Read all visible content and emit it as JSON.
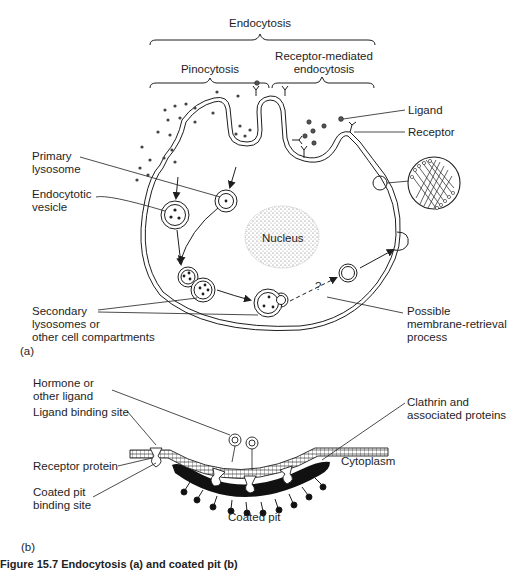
{
  "panel_a": {
    "label": "(a)",
    "brackets": {
      "top": "Endocytosis",
      "left": "Pinocytosis",
      "right_line1": "Receptor-mediated",
      "right_line2": "endocytosis"
    },
    "labels": {
      "ligand": "Ligand",
      "receptor": "Receptor",
      "primary_lysosome_1": "Primary",
      "primary_lysosome_2": "lysosome",
      "endocytotic_vesicle_1": "Endocytotic",
      "endocytotic_vesicle_2": "vesicle",
      "nucleus": "Nucleus",
      "secondary_1": "Secondary",
      "secondary_2": "lysosomes or",
      "secondary_3": "other cell compartments",
      "retrieval_1": "Possible",
      "retrieval_2": "membrane-retrieval",
      "retrieval_3": "process",
      "question_mark": "?"
    }
  },
  "panel_b": {
    "label": "(b)",
    "labels": {
      "hormone_1": "Hormone or",
      "hormone_2": "other ligand",
      "ligand_binding_site": "Ligand binding site",
      "receptor_protein": "Receptor protein",
      "coated_pit_binding_1": "Coated pit",
      "coated_pit_binding_2": "binding site",
      "clathrin_1": "Clathrin and",
      "clathrin_2": "associated proteins",
      "cytoplasm": "Cytoplasm",
      "coated_pit": "Coated pit"
    }
  },
  "caption": {
    "text": "Figure 15.7 Endocytosis (a) and coated pit (b)"
  },
  "colors": {
    "ink": "#1e1e1e",
    "background": "#ffffff",
    "coat": "#111111"
  }
}
